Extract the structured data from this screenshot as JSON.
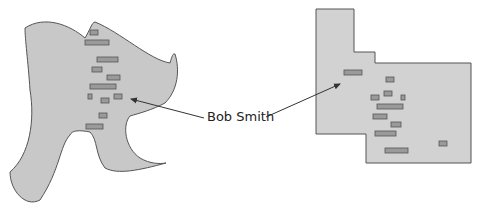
{
  "diagram": {
    "label": "Bob Smith",
    "colors": {
      "shape_fill": "#c8c8c8",
      "shape_stroke": "#555555",
      "rect_fill": "#9a9a9a",
      "rect_stroke": "#555555",
      "arrow": "#333333"
    },
    "left_shape": {
      "rects": [
        {
          "x": 90,
          "y": 30,
          "w": 8,
          "h": 5
        },
        {
          "x": 85,
          "y": 40,
          "w": 24,
          "h": 5
        },
        {
          "x": 97,
          "y": 57,
          "w": 21,
          "h": 5
        },
        {
          "x": 92,
          "y": 67,
          "w": 10,
          "h": 5
        },
        {
          "x": 107,
          "y": 75,
          "w": 13,
          "h": 5
        },
        {
          "x": 90,
          "y": 84,
          "w": 26,
          "h": 5
        },
        {
          "x": 88,
          "y": 94,
          "w": 4,
          "h": 5
        },
        {
          "x": 101,
          "y": 98,
          "w": 8,
          "h": 5
        },
        {
          "x": 114,
          "y": 94,
          "w": 8,
          "h": 5
        },
        {
          "x": 99,
          "y": 113,
          "w": 8,
          "h": 5
        },
        {
          "x": 86,
          "y": 124,
          "w": 17,
          "h": 5
        }
      ]
    },
    "right_shape": {
      "rects": [
        {
          "x": 344,
          "y": 70,
          "w": 18,
          "h": 5
        },
        {
          "x": 386,
          "y": 77,
          "w": 8,
          "h": 5
        },
        {
          "x": 384,
          "y": 91,
          "w": 8,
          "h": 5
        },
        {
          "x": 371,
          "y": 95,
          "w": 8,
          "h": 5
        },
        {
          "x": 401,
          "y": 95,
          "w": 4,
          "h": 5
        },
        {
          "x": 377,
          "y": 104,
          "w": 26,
          "h": 5
        },
        {
          "x": 373,
          "y": 114,
          "w": 14,
          "h": 5
        },
        {
          "x": 391,
          "y": 122,
          "w": 10,
          "h": 5
        },
        {
          "x": 375,
          "y": 131,
          "w": 21,
          "h": 5
        },
        {
          "x": 385,
          "y": 148,
          "w": 23,
          "h": 5
        },
        {
          "x": 439,
          "y": 141,
          "w": 8,
          "h": 5
        }
      ]
    }
  }
}
